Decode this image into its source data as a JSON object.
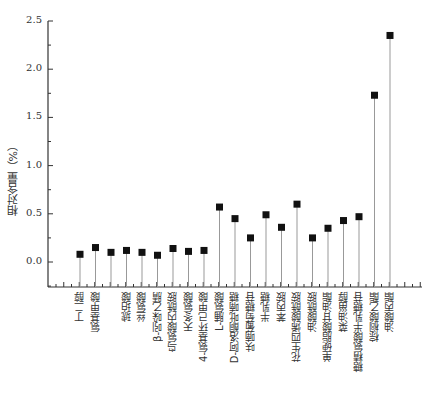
{
  "chart_data": {
    "type": "scatter",
    "subtype": "stem",
    "title": "",
    "xlabel": "",
    "ylabel": "相对含量（%）",
    "ylim": [
      -0.2,
      2.5
    ],
    "yticks": [
      0.0,
      0.5,
      1.0,
      1.5,
      2.0,
      2.5
    ],
    "ytick_labels": [
      "0.0",
      "0.5",
      "1.0",
      "1.5",
      "2.0",
      "2.5"
    ],
    "grid": false,
    "legend": null,
    "marker": "square",
    "marker_color": "#111111",
    "stem_color": "#999999",
    "categories": [
      "丁二醇",
      "氨基甲酸",
      "",
      "琥珀酸",
      "丝氨酸",
      "β-吲哚乙腈",
      "鸟氨酸内酰胺",
      "天冬氨酸",
      "4-氨基环己甲酸",
      "L-脯氨酸",
      "D-阿洛酮吡喃糖",
      "呋喃葡萄糖苷",
      "半乳糖",
      "苯丙胺",
      "花生四烯酸酰胺",
      "油酸酰胺",
      "单硬脂酸甘油酯",
      "菜油甾醇",
      "糖精氨酸半乳糖苷",
      "棕榈酸乙酯",
      "油酸丙酯"
    ],
    "values": [
      0.08,
      0.15,
      0.1,
      0.12,
      0.1,
      0.07,
      0.14,
      0.11,
      0.12,
      0.57,
      0.45,
      0.25,
      0.49,
      0.36,
      0.6,
      0.25,
      0.35,
      0.43,
      0.47,
      1.73,
      2.35
    ]
  }
}
